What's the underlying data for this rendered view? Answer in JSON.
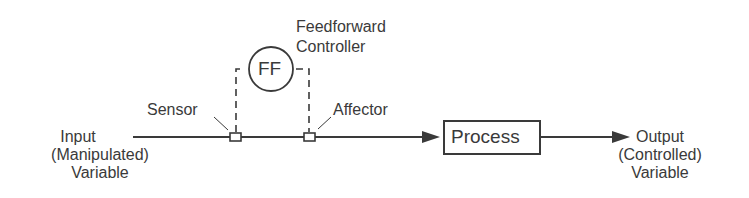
{
  "diagram": {
    "type": "feedforward-control-block-diagram",
    "controller": {
      "symbol": "FF",
      "label_line1": "Feedforward",
      "label_line2": "Controller"
    },
    "sensor_label": "Sensor",
    "affector_label": "Affector",
    "process_label": "Process",
    "input": {
      "line1": "Input",
      "line2": "(Manipulated)",
      "line3": "Variable"
    },
    "output": {
      "line1": "Output",
      "line2": "(Controlled)",
      "line3": "Variable"
    },
    "colors": {
      "stroke": "#3a3a3a",
      "background": "#ffffff"
    }
  }
}
